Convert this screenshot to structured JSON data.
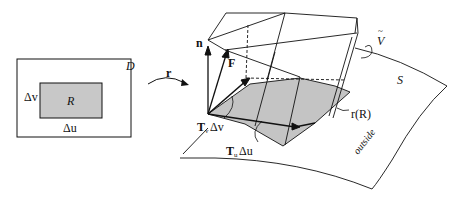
{
  "diagram": {
    "domain_box": {
      "label": "D",
      "inner_region_label": "R",
      "width_label": "Δu",
      "height_label": "Δv",
      "fill_color": "#c8c8c8"
    },
    "mapping_label": "r",
    "surface": {
      "label": "S",
      "side_label": "outside"
    },
    "vectors": {
      "normal": "n",
      "field": "F",
      "tangent_v": {
        "base": "T",
        "sub": "v",
        "suffix": "Δv"
      },
      "tangent_u": {
        "base": "T",
        "sub": "u",
        "suffix": "Δu"
      }
    },
    "image_region_label": "r(R)",
    "volume_label": "V",
    "volume_accent": "~",
    "colors": {
      "stroke": "#111111",
      "shaded": "#c4c4c4",
      "background": "#ffffff"
    }
  }
}
